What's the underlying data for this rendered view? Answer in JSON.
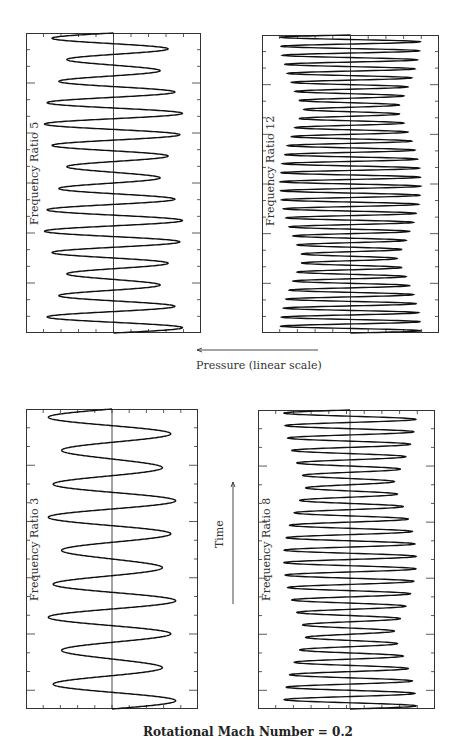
{
  "figure": {
    "title": "Rotational Mach Number = 0.2",
    "pressure_label": "Pressure (linear scale)",
    "time_label": "Time"
  },
  "chart_data": [
    {
      "type": "line",
      "title": "Frequency Ratio 5",
      "orientation": "vertical-time",
      "xlabel": "Pressure (linear scale)",
      "ylabel": "Time",
      "panel_box": {
        "x": 26,
        "y": 33,
        "w": 175,
        "h": 300
      },
      "centerline_frac": 0.5,
      "carrier_cycles": 14,
      "mod_cycles": 2.8,
      "amp_base": 0.55,
      "amp_mod": 0.35,
      "x_ticks": 10,
      "y_ticks": 18,
      "grid": false
    },
    {
      "type": "line",
      "title": "Frequency Ratio 12",
      "orientation": "vertical-time",
      "xlabel": "Pressure (linear scale)",
      "ylabel": "Time",
      "panel_box": {
        "x": 262,
        "y": 35,
        "w": 177,
        "h": 298
      },
      "centerline_frac": 0.5,
      "carrier_cycles": 33,
      "mod_cycles": 2.0,
      "amp_base": 0.6,
      "amp_mod": 0.3,
      "x_ticks": 10,
      "y_ticks": 18,
      "grid": false
    },
    {
      "type": "line",
      "title": "Frequency Ratio 3",
      "orientation": "vertical-time",
      "xlabel": "Pressure (linear scale)",
      "ylabel": "Time",
      "panel_box": {
        "x": 26,
        "y": 409,
        "w": 172,
        "h": 300
      },
      "centerline_frac": 0.5,
      "carrier_cycles": 9,
      "mod_cycles": 3.0,
      "amp_base": 0.6,
      "amp_mod": 0.25,
      "x_ticks": 10,
      "y_ticks": 16,
      "grid": false
    },
    {
      "type": "line",
      "title": "Frequency Ratio 8",
      "orientation": "vertical-time",
      "xlabel": "Pressure (linear scale)",
      "ylabel": "Time",
      "panel_box": {
        "x": 258,
        "y": 410,
        "w": 177,
        "h": 299
      },
      "centerline_frac": 0.52,
      "carrier_cycles": 24,
      "mod_cycles": 2.0,
      "amp_base": 0.55,
      "amp_mod": 0.3,
      "x_ticks": 10,
      "y_ticks": 16,
      "grid": false
    }
  ],
  "styles": {
    "line_color": "#111111",
    "axis_color": "#333333"
  }
}
